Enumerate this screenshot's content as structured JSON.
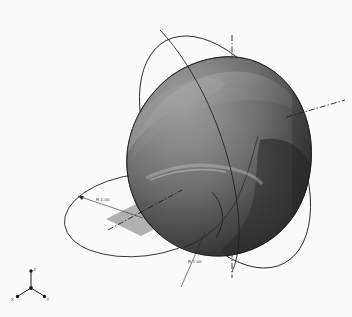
{
  "app": {
    "view_name": "3D Model Viewport",
    "background_color": "#fbfbfb"
  },
  "model": {
    "name": "blob-solid",
    "description": "Shaded revolved blob solid",
    "fill_light": "#8d8d8d",
    "fill_mid": "#6e6e6e",
    "fill_dark": "#3a3a3a",
    "fill_darkest": "#262626",
    "highlight": "#b4b4b4",
    "edge_color": "#1a1a1a"
  },
  "geometry": {
    "sketch_ellipse_tilted": {
      "name": "tilted-construction-ellipse",
      "stroke": "#1f1f1f",
      "stroke_width": 0.8
    },
    "sketch_ellipse_horizontal": {
      "name": "horizontal-construction-ellipse",
      "stroke": "#1f1f1f",
      "stroke_width": 0.8
    },
    "reference_plane": {
      "name": "reference-plane",
      "fill": "#a9a9a9",
      "opacity": 0.85
    },
    "centerlines": {
      "stroke": "#1f1f1f",
      "stroke_width": 0.8,
      "dash_pattern": "5 2 1 2"
    }
  },
  "annotations": {
    "dimension_upper_left": {
      "name": "radius-dimension-left",
      "label": "R 1.00"
    },
    "dimension_lower_center": {
      "name": "radius-dimension-bottom",
      "label": "R 1.00"
    }
  },
  "triad": {
    "name": "coordinate-triad",
    "axes": [
      {
        "key": "z",
        "label": "Z"
      },
      {
        "key": "x",
        "label": "X"
      },
      {
        "key": "y",
        "label": "Y"
      }
    ]
  }
}
